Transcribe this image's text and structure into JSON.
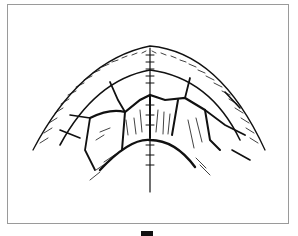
{
  "figure": {
    "frame_color": "#9a9a9a",
    "ink_color": "#111111",
    "caption_glyph": ""
  }
}
